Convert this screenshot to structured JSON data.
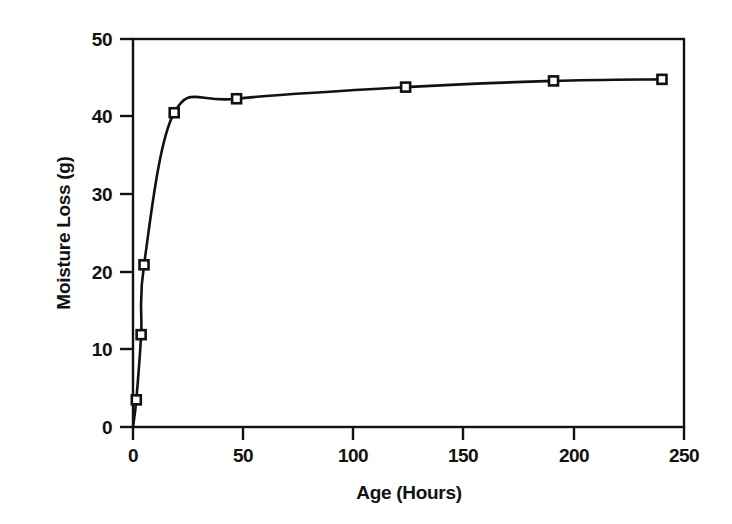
{
  "chart_data": {
    "type": "line",
    "title": "",
    "subtitle": "",
    "xlabel": "Age (Hours)",
    "ylabel": "Moisture Loss (g)",
    "xlim": [
      0,
      250
    ],
    "ylim": [
      0,
      50
    ],
    "xticks": [
      0,
      50,
      100,
      150,
      200,
      250
    ],
    "yticks": [
      0,
      10,
      20,
      30,
      40,
      50
    ],
    "xtick_labels": [
      "0",
      "50",
      "100",
      "150",
      "200",
      "250"
    ],
    "ytick_labels": [
      "0",
      "10",
      "20",
      "30",
      "40",
      "50"
    ],
    "grid": false,
    "legend": null,
    "legend_position": "none",
    "marker": "open-square",
    "line_color": "#111111",
    "marker_color": "#111111",
    "series": [
      {
        "name": "Moisture Loss",
        "x": [
          0,
          1.5,
          3.7,
          5.0,
          18.7,
          47.0,
          123.7,
          190.8,
          240.0
        ],
        "y": [
          0,
          3.5,
          11.9,
          20.9,
          40.5,
          42.3,
          43.8,
          44.6,
          44.8
        ]
      }
    ],
    "annotations": []
  },
  "axes": {
    "x_axis_name": "Age (Hours)",
    "y_axis_name": "Moisture Loss (g)"
  }
}
